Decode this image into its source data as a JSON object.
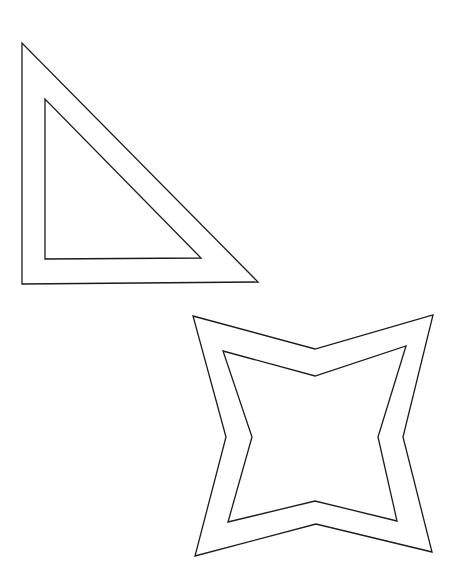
{
  "canvas": {
    "width": 458,
    "height": 572,
    "background": "#ffffff",
    "stroke_color": "#1a1a1a"
  },
  "shapes": [
    {
      "name": "triangle-frame",
      "type": "right-triangle-with-inner-offset",
      "outer_points": "22,43 22,284 258,282",
      "inner_points": "45,99 45,259 201,258"
    },
    {
      "name": "four-point-star-frame",
      "type": "concave-four-point-star-with-inner-offset",
      "outer_points": "193,316 315,349 433,315 403,437 432,552 316,524 195,556 226,437",
      "inner_points": "223,351 315,376 406,346 378,437 397,521 315,501 228,522 252,437"
    }
  ]
}
